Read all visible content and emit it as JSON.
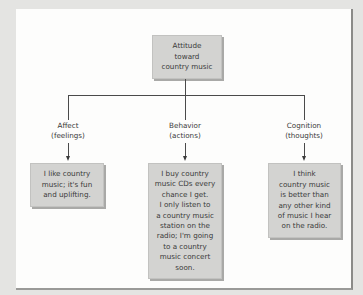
{
  "diagram": {
    "root": {
      "label": "Attitude\ntoward\ncountry music"
    },
    "components": [
      {
        "label": "Affect\n(feelings)",
        "example": "I like country\nmusic; it's fun\nand uplifting."
      },
      {
        "label": "Behavior\n(actions)",
        "example": "I buy country\nmusic CDs every\nchance I get.\nI only listen to\na country music\nstation on the\nradio; I'm going\nto a country\nmusic concert\nsoon."
      },
      {
        "label": "Cognition\n(thoughts)",
        "example": "I think\ncountry music\nis better than\nany other kind\nof music I hear\non the radio."
      }
    ],
    "colors": {
      "box_fill": "#d3d3d1",
      "panel": "#fdfdfc",
      "background": "#e4e4e2",
      "lines": "#4a4a4a"
    }
  }
}
